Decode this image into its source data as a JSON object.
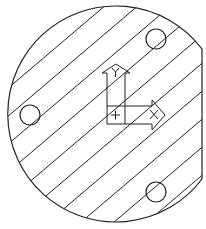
{
  "drawing": {
    "part": {
      "name": "circular-plate-with-flat",
      "outline": {
        "cx": 116,
        "cy": 114,
        "r": 108,
        "flat_x": 202
      },
      "hatch": {
        "pattern": "diagonal-lines",
        "spacing_px": 24,
        "stroke": "#222222"
      },
      "holes": [
        {
          "name": "hole-left",
          "cx": 30,
          "cy": 115,
          "r": 10
        },
        {
          "name": "hole-top-right",
          "cx": 156,
          "cy": 39,
          "r": 10
        },
        {
          "name": "hole-bottom-right",
          "cx": 156,
          "cy": 192,
          "r": 10
        }
      ]
    },
    "ucs_icon": {
      "origin_marker": "+",
      "x_label": "X",
      "y_label": "Y"
    },
    "colors": {
      "line": "#222222",
      "background": "#ffffff"
    }
  }
}
